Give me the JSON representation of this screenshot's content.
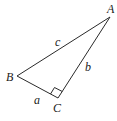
{
  "diagram": {
    "type": "right-triangle",
    "colors": {
      "stroke": "#2a2a2a",
      "text": "#222222",
      "background": "#ffffff"
    },
    "vertices": {
      "A": {
        "label": "A",
        "x": 110,
        "y": 17
      },
      "B": {
        "label": "B",
        "x": 17,
        "y": 76
      },
      "C": {
        "label": "C",
        "x": 58,
        "y": 98
      }
    },
    "sides": {
      "a": {
        "label": "a",
        "between": "B-C"
      },
      "b": {
        "label": "b",
        "between": "C-A"
      },
      "c": {
        "label": "c",
        "between": "A-B"
      }
    },
    "right_angle_at": "C"
  }
}
